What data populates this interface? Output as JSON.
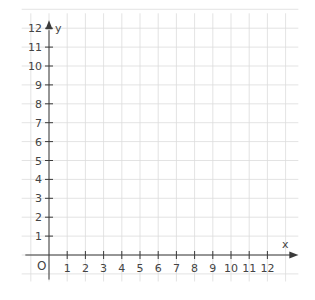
{
  "chart_data": {
    "type": "scatter",
    "title": "",
    "xlabel": "x",
    "ylabel": "y",
    "origin_label": "O",
    "xlim": [
      0,
      12
    ],
    "ylim": [
      0,
      12
    ],
    "x_ticks": [
      "1",
      "2",
      "3",
      "4",
      "5",
      "6",
      "7",
      "8",
      "9",
      "10",
      "11",
      "12"
    ],
    "y_ticks": [
      "1",
      "2",
      "3",
      "4",
      "5",
      "6",
      "7",
      "8",
      "9",
      "10",
      "11",
      "12"
    ],
    "grid": true,
    "series": [],
    "colors": {
      "axis": "#3a3a3a",
      "grid": "#dcdcdc",
      "text": "#444444"
    }
  }
}
